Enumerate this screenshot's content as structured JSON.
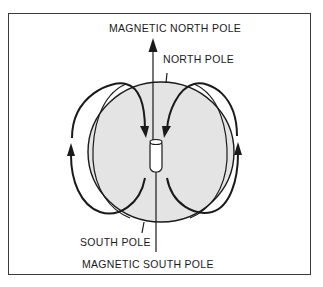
{
  "diagram": {
    "labels": {
      "magnetic_north_pole": "MAGNETIC NORTH POLE",
      "north_pole": "NORTH POLE",
      "south_pole": "SOUTH POLE",
      "magnetic_south_pole": "MAGNETIC SOUTH POLE"
    },
    "colors": {
      "line": "#1a1a1a",
      "globe_fill": "#e4e4e4",
      "background": "#ffffff"
    }
  }
}
